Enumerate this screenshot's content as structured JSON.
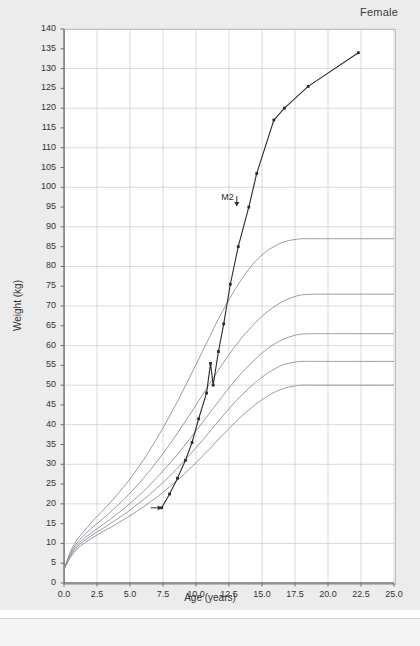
{
  "panel": {
    "sex_label": "Female"
  },
  "chart_data": {
    "type": "line",
    "title": "",
    "subtitle": "",
    "sex": "Female",
    "xlabel": "Age (years)",
    "ylabel": "Weight (kg)",
    "xlim": [
      0,
      25
    ],
    "ylim": [
      0,
      140
    ],
    "xticks": [
      "0.0",
      "2.5",
      "5.0",
      "7.5",
      "10.0",
      "12.5",
      "15.0",
      "17.5",
      "20.0",
      "22.5",
      "25.0"
    ],
    "xtick_values": [
      0,
      2.5,
      5,
      7.5,
      10,
      12.5,
      15,
      17.5,
      20,
      22.5,
      25
    ],
    "yticks": [
      "0",
      "5",
      "10",
      "15",
      "20",
      "25",
      "30",
      "35",
      "40",
      "45",
      "50",
      "55",
      "60",
      "65",
      "70",
      "75",
      "80",
      "85",
      "90",
      "95",
      "100",
      "105",
      "110",
      "115",
      "120",
      "125",
      "130",
      "135",
      "140"
    ],
    "ytick_values": [
      0,
      5,
      10,
      15,
      20,
      25,
      30,
      35,
      40,
      45,
      50,
      55,
      60,
      65,
      70,
      75,
      80,
      85,
      90,
      95,
      100,
      105,
      110,
      115,
      120,
      125,
      130,
      135,
      140
    ],
    "grid": true,
    "grid_x_step": 2.5,
    "grid_y_step": 10,
    "legend_position": "none",
    "annotations": [
      {
        "text": "M2",
        "x": 12.6,
        "y": 96,
        "marker": "down-arrow"
      },
      {
        "text": "",
        "x": 7.4,
        "y": 19,
        "marker": "right-arrow"
      }
    ],
    "series": [
      {
        "name": "reference-percentile-97",
        "kind": "reference",
        "color": "#8f8f97",
        "points": [
          [
            0.0,
            3.5
          ],
          [
            0.5,
            8.0
          ],
          [
            1.0,
            11.0
          ],
          [
            1.5,
            13.0
          ],
          [
            2.0,
            15.0
          ],
          [
            2.5,
            16.8
          ],
          [
            3.0,
            18.5
          ],
          [
            3.5,
            20.3
          ],
          [
            4.0,
            22.2
          ],
          [
            4.5,
            24.2
          ],
          [
            5.0,
            26.3
          ],
          [
            5.5,
            28.6
          ],
          [
            6.0,
            31.0
          ],
          [
            6.5,
            33.6
          ],
          [
            7.0,
            36.3
          ],
          [
            7.5,
            39.2
          ],
          [
            8.0,
            42.2
          ],
          [
            8.5,
            45.3
          ],
          [
            9.0,
            48.5
          ],
          [
            9.5,
            51.8
          ],
          [
            10.0,
            55.2
          ],
          [
            10.5,
            58.6
          ],
          [
            11.0,
            62.0
          ],
          [
            11.5,
            65.4
          ],
          [
            12.0,
            68.6
          ],
          [
            12.5,
            71.6
          ],
          [
            13.0,
            74.4
          ],
          [
            13.5,
            77.0
          ],
          [
            14.0,
            79.3
          ],
          [
            14.5,
            81.3
          ],
          [
            15.0,
            82.9
          ],
          [
            15.5,
            84.2
          ],
          [
            16.0,
            85.2
          ],
          [
            16.5,
            86.0
          ],
          [
            17.0,
            86.5
          ],
          [
            17.5,
            86.8
          ],
          [
            18.0,
            87.0
          ],
          [
            19.0,
            87.0
          ],
          [
            20.0,
            87.0
          ],
          [
            22.0,
            87.0
          ],
          [
            25.0,
            87.0
          ]
        ]
      },
      {
        "name": "reference-percentile-90",
        "kind": "reference",
        "color": "#8f8f97",
        "points": [
          [
            0.0,
            3.5
          ],
          [
            0.5,
            7.6
          ],
          [
            1.0,
            10.2
          ],
          [
            1.5,
            12.0
          ],
          [
            2.0,
            13.6
          ],
          [
            2.5,
            15.0
          ],
          [
            3.0,
            16.4
          ],
          [
            3.5,
            17.9
          ],
          [
            4.0,
            19.4
          ],
          [
            4.5,
            21.0
          ],
          [
            5.0,
            22.7
          ],
          [
            5.5,
            24.5
          ],
          [
            6.0,
            26.4
          ],
          [
            6.5,
            28.4
          ],
          [
            7.0,
            30.5
          ],
          [
            7.5,
            32.7
          ],
          [
            8.0,
            35.0
          ],
          [
            8.5,
            37.4
          ],
          [
            9.0,
            39.9
          ],
          [
            9.5,
            42.4
          ],
          [
            10.0,
            45.0
          ],
          [
            10.5,
            47.6
          ],
          [
            11.0,
            50.2
          ],
          [
            11.5,
            52.8
          ],
          [
            12.0,
            55.3
          ],
          [
            12.5,
            57.7
          ],
          [
            13.0,
            60.0
          ],
          [
            13.5,
            62.1
          ],
          [
            14.0,
            64.0
          ],
          [
            14.5,
            65.8
          ],
          [
            15.0,
            67.4
          ],
          [
            15.5,
            68.8
          ],
          [
            16.0,
            70.0
          ],
          [
            16.5,
            71.0
          ],
          [
            17.0,
            71.8
          ],
          [
            17.5,
            72.4
          ],
          [
            18.0,
            72.8
          ],
          [
            19.0,
            73.0
          ],
          [
            20.0,
            73.0
          ],
          [
            22.0,
            73.0
          ],
          [
            25.0,
            73.0
          ]
        ]
      },
      {
        "name": "reference-percentile-75",
        "kind": "reference",
        "color": "#8f8f97",
        "points": [
          [
            0.0,
            3.5
          ],
          [
            0.5,
            7.2
          ],
          [
            1.0,
            9.6
          ],
          [
            1.5,
            11.2
          ],
          [
            2.0,
            12.5
          ],
          [
            2.5,
            13.7
          ],
          [
            3.0,
            14.9
          ],
          [
            3.5,
            16.1
          ],
          [
            4.0,
            17.4
          ],
          [
            4.5,
            18.7
          ],
          [
            5.0,
            20.1
          ],
          [
            5.5,
            21.6
          ],
          [
            6.0,
            23.1
          ],
          [
            6.5,
            24.8
          ],
          [
            7.0,
            26.5
          ],
          [
            7.5,
            28.3
          ],
          [
            8.0,
            30.2
          ],
          [
            8.5,
            32.1
          ],
          [
            9.0,
            34.2
          ],
          [
            9.5,
            36.3
          ],
          [
            10.0,
            38.4
          ],
          [
            10.5,
            40.6
          ],
          [
            11.0,
            42.8
          ],
          [
            11.5,
            45.0
          ],
          [
            12.0,
            47.2
          ],
          [
            12.5,
            49.3
          ],
          [
            13.0,
            51.3
          ],
          [
            13.5,
            53.2
          ],
          [
            14.0,
            55.0
          ],
          [
            14.5,
            56.6
          ],
          [
            15.0,
            58.1
          ],
          [
            15.5,
            59.4
          ],
          [
            16.0,
            60.5
          ],
          [
            16.5,
            61.4
          ],
          [
            17.0,
            62.1
          ],
          [
            17.5,
            62.6
          ],
          [
            18.0,
            62.9
          ],
          [
            19.0,
            63.0
          ],
          [
            20.0,
            63.0
          ],
          [
            22.0,
            63.0
          ],
          [
            25.0,
            63.0
          ]
        ]
      },
      {
        "name": "reference-percentile-50",
        "kind": "reference",
        "color": "#8f8f97",
        "points": [
          [
            0.0,
            3.5
          ],
          [
            0.5,
            6.9
          ],
          [
            1.0,
            9.1
          ],
          [
            1.5,
            10.6
          ],
          [
            2.0,
            11.8
          ],
          [
            2.5,
            12.9
          ],
          [
            3.0,
            13.9
          ],
          [
            3.5,
            15.0
          ],
          [
            4.0,
            16.1
          ],
          [
            4.5,
            17.2
          ],
          [
            5.0,
            18.4
          ],
          [
            5.5,
            19.7
          ],
          [
            6.0,
            21.0
          ],
          [
            6.5,
            22.4
          ],
          [
            7.0,
            23.9
          ],
          [
            7.5,
            25.4
          ],
          [
            8.0,
            27.0
          ],
          [
            8.5,
            28.7
          ],
          [
            9.0,
            30.5
          ],
          [
            9.5,
            32.3
          ],
          [
            10.0,
            34.2
          ],
          [
            10.5,
            36.1
          ],
          [
            11.0,
            38.1
          ],
          [
            11.5,
            40.1
          ],
          [
            12.0,
            42.1
          ],
          [
            12.5,
            44.0
          ],
          [
            13.0,
            45.9
          ],
          [
            13.5,
            47.6
          ],
          [
            14.0,
            49.2
          ],
          [
            14.5,
            50.7
          ],
          [
            15.0,
            52.0
          ],
          [
            15.5,
            53.2
          ],
          [
            16.0,
            54.2
          ],
          [
            16.5,
            55.0
          ],
          [
            17.0,
            55.5
          ],
          [
            17.5,
            55.8
          ],
          [
            18.0,
            56.0
          ],
          [
            19.0,
            56.0
          ],
          [
            20.0,
            56.0
          ],
          [
            22.0,
            56.0
          ],
          [
            25.0,
            56.0
          ]
        ]
      },
      {
        "name": "reference-percentile-25",
        "kind": "reference",
        "color": "#8f8f97",
        "points": [
          [
            0.0,
            3.5
          ],
          [
            0.5,
            6.5
          ],
          [
            1.0,
            8.6
          ],
          [
            1.5,
            10.0
          ],
          [
            2.0,
            11.1
          ],
          [
            2.5,
            12.1
          ],
          [
            3.0,
            13.1
          ],
          [
            3.5,
            14.0
          ],
          [
            4.0,
            15.0
          ],
          [
            4.5,
            16.0
          ],
          [
            5.0,
            17.0
          ],
          [
            5.5,
            18.1
          ],
          [
            6.0,
            19.2
          ],
          [
            6.5,
            20.4
          ],
          [
            7.0,
            21.6
          ],
          [
            7.5,
            22.9
          ],
          [
            8.0,
            24.3
          ],
          [
            8.5,
            25.7
          ],
          [
            9.0,
            27.2
          ],
          [
            9.5,
            28.8
          ],
          [
            10.0,
            30.4
          ],
          [
            10.5,
            32.1
          ],
          [
            11.0,
            33.8
          ],
          [
            11.5,
            35.6
          ],
          [
            12.0,
            37.3
          ],
          [
            12.5,
            39.0
          ],
          [
            13.0,
            40.7
          ],
          [
            13.5,
            42.3
          ],
          [
            14.0,
            43.7
          ],
          [
            14.5,
            45.1
          ],
          [
            15.0,
            46.3
          ],
          [
            15.5,
            47.4
          ],
          [
            16.0,
            48.3
          ],
          [
            16.5,
            49.0
          ],
          [
            17.0,
            49.5
          ],
          [
            17.5,
            49.8
          ],
          [
            18.0,
            50.0
          ],
          [
            19.0,
            50.0
          ],
          [
            20.0,
            50.0
          ],
          [
            22.0,
            50.0
          ],
          [
            25.0,
            50.0
          ]
        ]
      },
      {
        "name": "patient-weight",
        "kind": "patient",
        "color": "#2b2b2b",
        "marker": "square",
        "points": [
          [
            7.4,
            19.0
          ],
          [
            8.0,
            22.5
          ],
          [
            8.6,
            26.5
          ],
          [
            9.2,
            31.0
          ],
          [
            9.7,
            35.5
          ],
          [
            10.2,
            41.5
          ],
          [
            10.8,
            48.0
          ],
          [
            11.1,
            55.5
          ],
          [
            11.3,
            50.0
          ],
          [
            11.7,
            58.5
          ],
          [
            12.1,
            65.5
          ],
          [
            12.6,
            75.5
          ],
          [
            13.2,
            85.0
          ],
          [
            14.0,
            95.0
          ],
          [
            14.6,
            103.5
          ],
          [
            15.9,
            117.0
          ],
          [
            16.7,
            120.0
          ],
          [
            18.5,
            125.5
          ],
          [
            22.3,
            134.0
          ]
        ]
      }
    ]
  }
}
